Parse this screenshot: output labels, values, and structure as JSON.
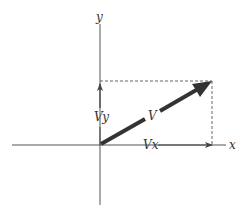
{
  "diagram": {
    "labels": {
      "x_axis": "x",
      "y_axis": "y",
      "vector": "V",
      "x_component": "Vx",
      "y_component": "Vy"
    },
    "colors": {
      "axis": "#555555",
      "vector": "#333333",
      "dashed": "#666666",
      "background": "#ffffff"
    }
  }
}
